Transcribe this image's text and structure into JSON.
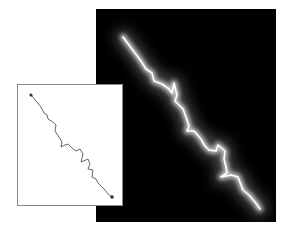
{
  "figure": {
    "background_color": "#ffffff",
    "micrograph_panel": {
      "background_color": "#000000",
      "glow_color": "#ffffff",
      "halo_color": "#9a9a9a",
      "path_points": "27,28 36,40 45,52 50,60 56,64 58,72 66,75 73,80 76,84 78,74 81,86 79,92 87,100 90,108 93,117 91,122 98,122 105,130 109,137 113,141 120,142 122,136 129,142 128,150 130,158 131,164 125,168 135,166 142,168 147,181 153,186 159,193 164,200"
    },
    "trace_panel": {
      "border_color": "#8a8a8a",
      "line_color": "#555555",
      "marker_color": "#333333",
      "start_marker": {
        "x": 13,
        "y": 10
      },
      "end_marker": {
        "x": 94,
        "y": 112
      },
      "path_points": "13,10 18,16 23,22 26,28 29,30 30,34 35,37 38,40 37,46 41,52 44,57 43,62 47,60 50,59 54,63 58,66 62,64 65,69 63,77 70,74 72,79 70,84 75,85 74,92 78,94 80,98 84,102 87,105 90,109 94,112"
    }
  }
}
